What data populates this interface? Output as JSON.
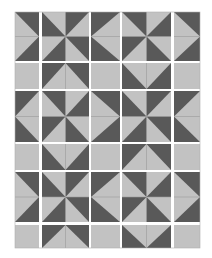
{
  "diagram": {
    "type": "quilt-block-layout",
    "colors": {
      "dark": "#595959",
      "light": "#c2c2c2",
      "sashing": "#ffffff",
      "seam": "#9a9a9a",
      "background": "#ffffff"
    },
    "columns": [
      {
        "x": 15,
        "w": 24
      },
      {
        "x": 42,
        "w": 47
      },
      {
        "x": 91,
        "w": 29
      },
      {
        "x": 122,
        "w": 49
      },
      {
        "x": 174,
        "w": 26
      }
    ],
    "rows": [
      {
        "y": 12,
        "h": 49,
        "kind": "block"
      },
      {
        "y": 63,
        "h": 26,
        "kind": "strip"
      },
      {
        "y": 91,
        "h": 51,
        "kind": "block"
      },
      {
        "y": 144,
        "h": 26,
        "kind": "strip"
      },
      {
        "y": 172,
        "h": 50,
        "kind": "block"
      },
      {
        "y": 225,
        "h": 23,
        "kind": "strip"
      }
    ],
    "grid": [
      [
        "point-right",
        "pinwheel-a",
        "point-left",
        "pinwheel-b",
        "point-right"
      ],
      [
        "plain",
        "point-up",
        "plain",
        "point-down",
        "plain"
      ],
      [
        "point-left",
        "pinwheel-b",
        "point-right",
        "pinwheel-a",
        "point-left"
      ],
      [
        "plain",
        "point-down",
        "plain",
        "point-up",
        "plain"
      ],
      [
        "point-right",
        "pinwheel-a",
        "point-left",
        "pinwheel-b",
        "point-right"
      ],
      [
        "plain",
        "point-up",
        "plain",
        "point-down",
        "plain"
      ]
    ]
  }
}
